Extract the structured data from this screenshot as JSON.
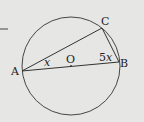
{
  "diagram": {
    "type": "circle-geometry",
    "points": {
      "A": {
        "label": "A"
      },
      "B": {
        "label": "B"
      },
      "C": {
        "label": "C"
      },
      "O": {
        "label": "O"
      }
    },
    "angles": {
      "at_A": "x",
      "at_B_coef": "5",
      "at_B_var": "x"
    },
    "colors": {
      "background": "#e6e6e4",
      "stroke": "#333333"
    }
  }
}
